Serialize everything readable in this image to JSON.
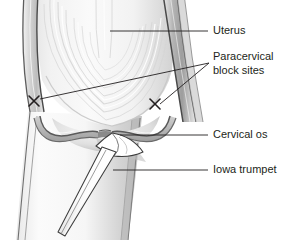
{
  "figure": {
    "type": "medical-anatomical-illustration",
    "background_color": "#ffffff",
    "line_color": "#231f20",
    "text_color": "#231f20",
    "tissue_light": "#f5f5f5",
    "tissue_mid": "#d8d8d8",
    "tissue_shadow": "#9a9a9a",
    "instrument_color": "#ffffff"
  },
  "labels": [
    {
      "id": "uterus",
      "text": "Uterus",
      "x": 213,
      "y": 31,
      "lines": [
        "Uterus"
      ],
      "leader": {
        "type": "straight",
        "from_x": 208,
        "from_y": 31,
        "to_x": 110,
        "to_y": 31
      }
    },
    {
      "id": "paracervical-block-sites",
      "text": "Paracervical block sites",
      "x": 213,
      "y": 57,
      "lines": [
        "Paracervical",
        "block sites"
      ],
      "leader": {
        "type": "forked",
        "vertex_x": 209,
        "vertex_y": 63
      }
    },
    {
      "id": "cervical-os",
      "text": "Cervical os",
      "x": 213,
      "y": 135,
      "lines": [
        "Cervical os"
      ],
      "leader": {
        "type": "straight",
        "from_x": 208,
        "from_y": 135,
        "to_x": 120,
        "to_y": 135
      }
    },
    {
      "id": "iowa-trumpet",
      "text": "Iowa trumpet",
      "x": 213,
      "y": 170,
      "lines": [
        "Iowa trumpet"
      ],
      "leader": {
        "type": "straight",
        "from_x": 208,
        "from_y": 170,
        "to_x": 113,
        "to_y": 170
      }
    }
  ],
  "markers": [
    {
      "id": "injection-site-left",
      "glyph": "X",
      "x": 34,
      "y": 101
    },
    {
      "id": "injection-site-right",
      "glyph": "X",
      "x": 155,
      "y": 104
    }
  ],
  "structures": [
    {
      "id": "uterine-body",
      "name": "Uterine body"
    },
    {
      "id": "uterine-wall-left",
      "name": "Left uterine wall"
    },
    {
      "id": "uterine-wall-right",
      "name": "Right uterine wall"
    },
    {
      "id": "myometrial-striations",
      "name": "Myometrial fiber striations"
    },
    {
      "id": "vaginal-fornix-left",
      "name": "Left vaginal fornix"
    },
    {
      "id": "vaginal-fornix-right",
      "name": "Right vaginal fornix"
    },
    {
      "id": "cervix",
      "name": "Cervix"
    },
    {
      "id": "vaginal-canal",
      "name": "Vaginal canal"
    },
    {
      "id": "iowa-trumpet-instrument",
      "name": "Iowa trumpet needle guide"
    },
    {
      "id": "iowa-trumpet-tip",
      "name": "Flared trumpet tip at cervical os"
    }
  ]
}
